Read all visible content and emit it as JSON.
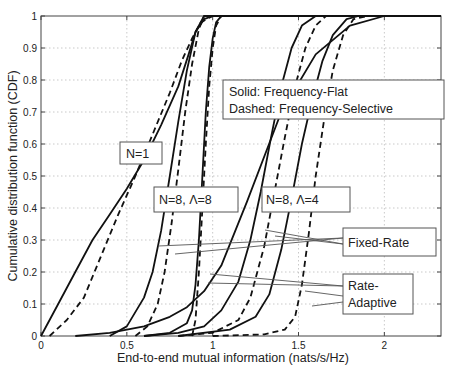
{
  "chart_data": {
    "type": "line",
    "title": "",
    "xlabel": "End-to-end mutual information (nats/s/Hz)",
    "ylabel": "Cumulative distribution function (CDF)",
    "xlim": [
      0,
      2.33
    ],
    "ylim": [
      0,
      1
    ],
    "xticks": [
      0,
      0.5,
      1,
      1.5,
      2
    ],
    "xtick_labels": [
      "0",
      "0.5",
      "1",
      "1.5",
      "2"
    ],
    "yticks": [
      0,
      0.1,
      0.2,
      0.3,
      0.4,
      0.5,
      0.6,
      0.7,
      0.8,
      0.9,
      1
    ],
    "ytick_labels": [
      "0",
      "0.1",
      "0.2",
      "0.3",
      "0.4",
      "0.5",
      "0.6",
      "0.7",
      "0.8",
      "0.9",
      "1"
    ],
    "grid": true,
    "legend_note": [
      "Solid: Frequency-Flat",
      "Dashed: Frequency-Selective"
    ],
    "annotations": [
      {
        "id": "n1",
        "text": "N=1"
      },
      {
        "id": "n8l8",
        "text": "N=8, Λ=8"
      },
      {
        "id": "n8l4",
        "text": "N=8, Λ=4"
      },
      {
        "id": "fixed",
        "text": "Fixed-Rate"
      },
      {
        "id": "adaptive_1",
        "text": "Rate-"
      },
      {
        "id": "adaptive_2",
        "text": "Adaptive"
      }
    ],
    "series": [
      {
        "name": "N=1 Fixed-Rate, Frequency-Flat",
        "style": "solid",
        "x": [
          0,
          0.1,
          0.2,
          0.3,
          0.4,
          0.5,
          0.6,
          0.7,
          0.8,
          0.86,
          0.9,
          0.95,
          1.0
        ],
        "y": [
          0,
          0.1,
          0.2,
          0.3,
          0.38,
          0.46,
          0.55,
          0.66,
          0.78,
          0.88,
          0.95,
          0.99,
          1
        ]
      },
      {
        "name": "N=1 Fixed-Rate, Frequency-Selective",
        "style": "dashed",
        "x": [
          0.05,
          0.15,
          0.25,
          0.35,
          0.45,
          0.55,
          0.65,
          0.75,
          0.82,
          0.88,
          0.93,
          1.0
        ],
        "y": [
          0,
          0.05,
          0.12,
          0.25,
          0.38,
          0.5,
          0.63,
          0.76,
          0.86,
          0.93,
          0.98,
          1
        ]
      },
      {
        "name": "N=1 Rate-Adaptive, Frequency-Flat",
        "style": "solid",
        "x": [
          0.2,
          0.4,
          0.6,
          0.75,
          0.85,
          0.95,
          1.05,
          1.2,
          1.4,
          1.6,
          1.8,
          2.0
        ],
        "y": [
          0,
          0.01,
          0.03,
          0.06,
          0.09,
          0.14,
          0.22,
          0.42,
          0.7,
          0.88,
          0.97,
          1
        ]
      },
      {
        "name": "N=8 Λ=8 Fixed-Rate, Frequency-Flat",
        "style": "solid",
        "x": [
          0.4,
          0.5,
          0.6,
          0.65,
          0.7,
          0.75,
          0.8,
          0.85,
          0.9,
          0.95
        ],
        "y": [
          0,
          0.03,
          0.12,
          0.2,
          0.33,
          0.5,
          0.67,
          0.83,
          0.95,
          1
        ]
      },
      {
        "name": "N=8 Λ=8 Fixed-Rate, Frequency-Selective",
        "style": "dashed",
        "x": [
          0.55,
          0.62,
          0.68,
          0.72,
          0.76,
          0.8,
          0.84,
          0.88,
          0.92,
          0.95
        ],
        "y": [
          0,
          0.03,
          0.1,
          0.2,
          0.35,
          0.52,
          0.7,
          0.85,
          0.96,
          1
        ]
      },
      {
        "name": "N=8 Λ=8 Rate-Adaptive, Frequency-Flat",
        "style": "solid",
        "x": [
          0.6,
          0.75,
          0.85,
          0.88,
          0.9,
          0.92,
          0.94,
          0.96,
          0.98,
          1.0,
          1.02,
          1.05
        ],
        "y": [
          0,
          0.01,
          0.04,
          0.08,
          0.16,
          0.3,
          0.5,
          0.7,
          0.84,
          0.93,
          0.98,
          1
        ]
      },
      {
        "name": "N=8 Λ=8 Rate-Adaptive, Frequency-Selective",
        "style": "dashed",
        "x": [
          0.88,
          0.9,
          0.92,
          0.94,
          0.96,
          0.98,
          1.0,
          1.02,
          1.05
        ],
        "y": [
          0,
          0.05,
          0.2,
          0.4,
          0.6,
          0.78,
          0.9,
          0.97,
          1
        ]
      },
      {
        "name": "N=8 Λ=4 Fixed-Rate, Frequency-Flat",
        "style": "solid",
        "x": [
          0.6,
          0.8,
          0.95,
          1.05,
          1.15,
          1.22,
          1.28,
          1.34,
          1.4,
          1.46,
          1.52,
          1.6
        ],
        "y": [
          0,
          0.01,
          0.03,
          0.08,
          0.17,
          0.3,
          0.45,
          0.62,
          0.78,
          0.9,
          0.97,
          1
        ]
      },
      {
        "name": "N=8 Λ=4 Fixed-Rate, Frequency-Selective",
        "style": "dashed",
        "x": [
          0.8,
          1.0,
          1.15,
          1.22,
          1.3,
          1.36,
          1.42,
          1.48,
          1.54,
          1.6,
          1.66
        ],
        "y": [
          0,
          0.01,
          0.05,
          0.12,
          0.28,
          0.45,
          0.62,
          0.78,
          0.9,
          0.97,
          1
        ]
      },
      {
        "name": "N=8 Λ=4 Rate-Adaptive, Frequency-Flat",
        "style": "solid",
        "x": [
          0.8,
          1.1,
          1.25,
          1.33,
          1.4,
          1.46,
          1.52,
          1.58,
          1.64,
          1.7,
          1.78,
          1.85
        ],
        "y": [
          0,
          0.02,
          0.06,
          0.13,
          0.27,
          0.43,
          0.6,
          0.74,
          0.86,
          0.94,
          0.99,
          1
        ]
      },
      {
        "name": "N=8 Λ=4 Rate-Adaptive, Frequency-Selective",
        "style": "dashed",
        "x": [
          1.0,
          1.3,
          1.42,
          1.48,
          1.52,
          1.56,
          1.6,
          1.65,
          1.7,
          1.76,
          1.82,
          1.9
        ],
        "y": [
          0,
          0.005,
          0.02,
          0.06,
          0.16,
          0.32,
          0.5,
          0.68,
          0.83,
          0.94,
          0.99,
          1
        ]
      }
    ]
  }
}
